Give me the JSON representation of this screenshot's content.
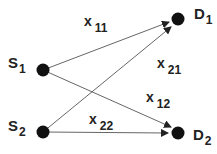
{
  "diagram": {
    "type": "bipartite-flow",
    "sources": [
      {
        "id": "S1",
        "name": "S",
        "sub": "1"
      },
      {
        "id": "S2",
        "name": "S",
        "sub": "2"
      }
    ],
    "destinations": [
      {
        "id": "D1",
        "name": "D",
        "sub": "1"
      },
      {
        "id": "D2",
        "name": "D",
        "sub": "2"
      }
    ],
    "edges": [
      {
        "from": "S1",
        "to": "D1",
        "var": "x",
        "sub": "11"
      },
      {
        "from": "S2",
        "to": "D1",
        "var": "x",
        "sub": "21"
      },
      {
        "from": "S1",
        "to": "D2",
        "var": "x",
        "sub": "12"
      },
      {
        "from": "S2",
        "to": "D2",
        "var": "x",
        "sub": "22"
      }
    ],
    "colors": {
      "node": "#111111",
      "edge": "#555555",
      "text": "#222222"
    }
  }
}
